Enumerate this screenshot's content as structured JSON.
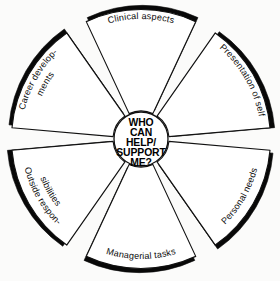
{
  "diagram": {
    "hub": {
      "lines": [
        "WHO",
        "CAN",
        "HELP/",
        "SUPPORT",
        "ME?"
      ],
      "line1": "WHO",
      "line2": "CAN",
      "line3": "HELP/",
      "line4": "SUPPORT",
      "line5": "ME?"
    },
    "colors": {
      "outline": "#111111",
      "shadow": "#080808",
      "face": "#ffffff",
      "background": "#fbfbfa"
    },
    "geometry": {
      "center_x": 141,
      "center_y": 139,
      "outer_radius": 131,
      "inner_radius": 27,
      "petal_span_degrees": 50,
      "gap_degrees": 10,
      "petal_count": 6
    },
    "petals": [
      {
        "id": "clinical-aspects",
        "label": "Clinical aspects",
        "line1": "Clinical aspects",
        "line2": "",
        "center_angle": 270,
        "position": "top"
      },
      {
        "id": "presentation-of-self",
        "label": "Presentation of self",
        "line1": "Presentation of self",
        "line2": "",
        "center_angle": 330,
        "position": "upper-right"
      },
      {
        "id": "personal-needs",
        "label": "Personal needs",
        "line1": "Personal needs",
        "line2": "",
        "center_angle": 30,
        "position": "lower-right"
      },
      {
        "id": "managerial-tasks",
        "label": "Managerial tasks",
        "line1": "Managerial tasks",
        "line2": "",
        "center_angle": 90,
        "position": "bottom"
      },
      {
        "id": "outside-responsibilities",
        "label": "Outside responsibilities",
        "line1": "Outside respon-",
        "line2": "sibilities",
        "center_angle": 150,
        "position": "lower-left"
      },
      {
        "id": "career-developments",
        "label": "Career developments",
        "line1": "Career develop-",
        "line2": "ments",
        "center_angle": 210,
        "position": "upper-left"
      }
    ]
  }
}
